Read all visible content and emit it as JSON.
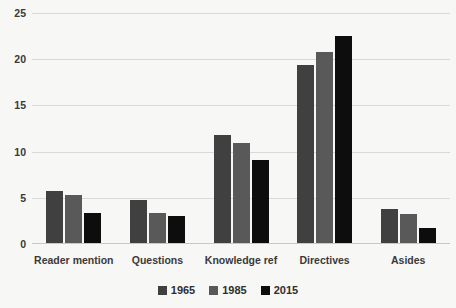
{
  "chart_data": {
    "type": "bar",
    "title": "",
    "subtitle": "",
    "xlabel": "",
    "ylabel": "",
    "categories": [
      "Reader mention",
      "Questions",
      "Knowledge ref",
      "Directives",
      "Asides"
    ],
    "series": [
      {
        "name": "1965",
        "color": "#404040",
        "values": [
          5.7,
          4.8,
          11.8,
          19.4,
          3.8
        ]
      },
      {
        "name": "1985",
        "color": "#595959",
        "values": [
          5.3,
          3.4,
          10.9,
          20.8,
          3.3
        ]
      },
      {
        "name": "2015",
        "color": "#0d0d0d",
        "values": [
          3.4,
          3.0,
          9.1,
          22.5,
          1.7
        ]
      }
    ],
    "ylim": [
      0,
      25
    ],
    "yticks": [
      0,
      5,
      10,
      15,
      20,
      25
    ],
    "ytick_labels": [
      "0",
      "5",
      "10",
      "15",
      "20",
      "25"
    ],
    "grid": true,
    "grid_axis": "y",
    "legend_position": "bottom",
    "background_color": "#f7f7f5",
    "gridline_color": "#d9d9d9",
    "text_color": "#3a3a3a"
  }
}
